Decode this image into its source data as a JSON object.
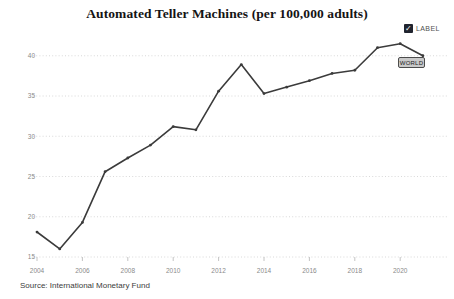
{
  "header": {
    "title": "Automated Teller Machines (per 100,000 adults)"
  },
  "legend": {
    "label": "LABEL",
    "checked": true,
    "check_glyph": "✓",
    "checkbox_color": "#20242e"
  },
  "series_label": {
    "text": "WORLD"
  },
  "footer": {
    "source": "Source: International Monetary Fund"
  },
  "colors": {
    "line": "#3b3b3b",
    "grid": "#cfcfcf",
    "axis_text": "#8a8a8a",
    "background": "#ffffff"
  },
  "chart_data": {
    "type": "line",
    "title": "Automated Teller Machines (per 100,000 adults)",
    "xlabel": "",
    "ylabel": "",
    "xlim": [
      2004,
      2021.5
    ],
    "ylim": [
      15,
      42
    ],
    "grid": "horizontal-dotted",
    "legend_position": "top-right",
    "line_color": "#3b3b3b",
    "yticks": [
      15,
      20,
      25,
      30,
      35,
      40
    ],
    "xticks": [
      2004,
      2006,
      2008,
      2010,
      2012,
      2014,
      2016,
      2018,
      2020
    ],
    "series": [
      {
        "name": "WORLD",
        "x": [
          2004,
          2005,
          2006,
          2007,
          2008,
          2009,
          2010,
          2011,
          2012,
          2013,
          2014,
          2015,
          2016,
          2017,
          2018,
          2019,
          2020,
          2021
        ],
        "values": [
          18.1,
          16.0,
          19.3,
          25.6,
          27.3,
          28.9,
          31.2,
          30.8,
          35.6,
          38.9,
          35.3,
          36.1,
          36.9,
          37.8,
          38.2,
          41.0,
          41.5,
          40.0
        ]
      }
    ]
  }
}
